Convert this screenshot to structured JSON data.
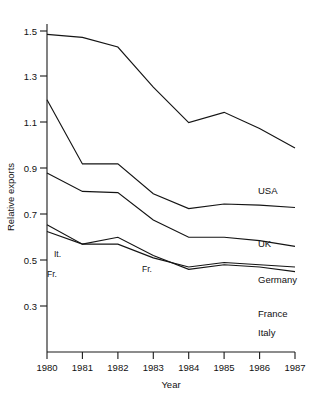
{
  "chart_data": {
    "type": "line",
    "title": "",
    "xlabel": "Year",
    "ylabel": "Relative exports",
    "x": [
      1980,
      1981,
      1982,
      1983,
      1984,
      1985,
      1986,
      1987
    ],
    "categories": [
      "1980",
      "1981",
      "1982",
      "1983",
      "1984",
      "1985",
      "1986",
      "1987"
    ],
    "xlim": [
      1980,
      1987
    ],
    "ylim": [
      0.3,
      1.6
    ],
    "yticks": [
      1.5,
      1.3,
      1.1,
      0.9,
      0.7,
      0.5,
      0.3
    ],
    "ytick_labels": [
      "1.5",
      "1.3",
      "1.1",
      "0.9",
      "0.7",
      "0.5",
      "0.3"
    ],
    "xticks": [
      1980,
      1981,
      1982,
      1983,
      1984,
      1985,
      1986,
      1987
    ],
    "grid": false,
    "legend_position": "right-of-line-ends",
    "series": [
      {
        "name": "USA",
        "label": "USA",
        "values": [
          1.485,
          1.472,
          1.43,
          1.255,
          1.1,
          1.145,
          1.075,
          0.99
        ]
      },
      {
        "name": "UK",
        "label": "UK",
        "values": [
          1.2,
          0.92,
          0.92,
          0.79,
          0.725,
          0.745,
          0.74,
          0.73
        ]
      },
      {
        "name": "Germany",
        "label": "Germany",
        "values": [
          0.88,
          0.8,
          0.795,
          0.675,
          0.6,
          0.6,
          0.585,
          0.56
        ]
      },
      {
        "name": "France",
        "label": "France",
        "values": [
          0.625,
          0.57,
          0.57,
          0.51,
          0.47,
          0.49,
          0.48,
          0.47
        ]
      },
      {
        "name": "Italy",
        "label": "Italy",
        "values": [
          0.655,
          0.57,
          0.6,
          0.52,
          0.46,
          0.48,
          0.47,
          0.45
        ]
      }
    ],
    "annotations": [
      {
        "text": "It.",
        "series": "Italy",
        "x": 1980,
        "y": 0.655
      },
      {
        "text": "Fr.",
        "series": "France",
        "x": 1980,
        "y": 0.625
      },
      {
        "text": "Fr.",
        "series": "France",
        "x": 1982.3,
        "y": 0.585
      }
    ]
  },
  "axis": {
    "y_title": "Relative exports",
    "x_title": "Year",
    "y_ticks": [
      "1.5",
      "1.3",
      "1.1",
      "0.9",
      "0.7",
      "0.5",
      "0.3"
    ],
    "x_ticks": [
      "1980",
      "1981",
      "1982",
      "1983",
      "1984",
      "1985",
      "1986",
      "1987"
    ]
  },
  "labels": {
    "usa": "USA",
    "uk": "UK",
    "germany": "Germany",
    "france": "France",
    "italy": "Italy",
    "it_short": "It.",
    "fr_short_left": "Fr.",
    "fr_short_mid": "Fr."
  },
  "colors": {
    "line": "#141414",
    "axis": "#1a1a1a",
    "background": "#ffffff"
  }
}
